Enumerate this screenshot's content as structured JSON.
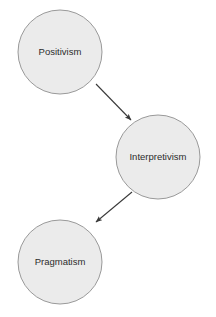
{
  "diagram": {
    "background_color": "#ffffff",
    "node_fill_color": "#ebebeb",
    "node_stroke_color": "#999999",
    "label_color": "#2b2b2b",
    "edge_color": "#3a3a3a",
    "nodes": [
      {
        "id": "positivism",
        "label": "Positivism",
        "shape": "circle",
        "cx": 60,
        "cy": 52,
        "r": 42
      },
      {
        "id": "interpretivism",
        "label": "Interpretivism",
        "shape": "circle",
        "cx": 158,
        "cy": 157,
        "r": 42
      },
      {
        "id": "pragmatism",
        "label": "Pragmatism",
        "shape": "circle",
        "cx": 60,
        "cy": 262,
        "r": 42
      }
    ],
    "edges": [
      {
        "id": "edge-positivism-interpretivism",
        "from": "positivism",
        "to": "interpretivism",
        "label": "",
        "arrow": "end",
        "x1": 96,
        "y1": 84,
        "x2": 132,
        "y2": 121
      },
      {
        "id": "edge-interpretivism-pragmatism",
        "from": "interpretivism",
        "to": "pragmatism",
        "label": "",
        "arrow": "end",
        "x1": 132,
        "y1": 192,
        "x2": 95,
        "y2": 223
      }
    ]
  }
}
